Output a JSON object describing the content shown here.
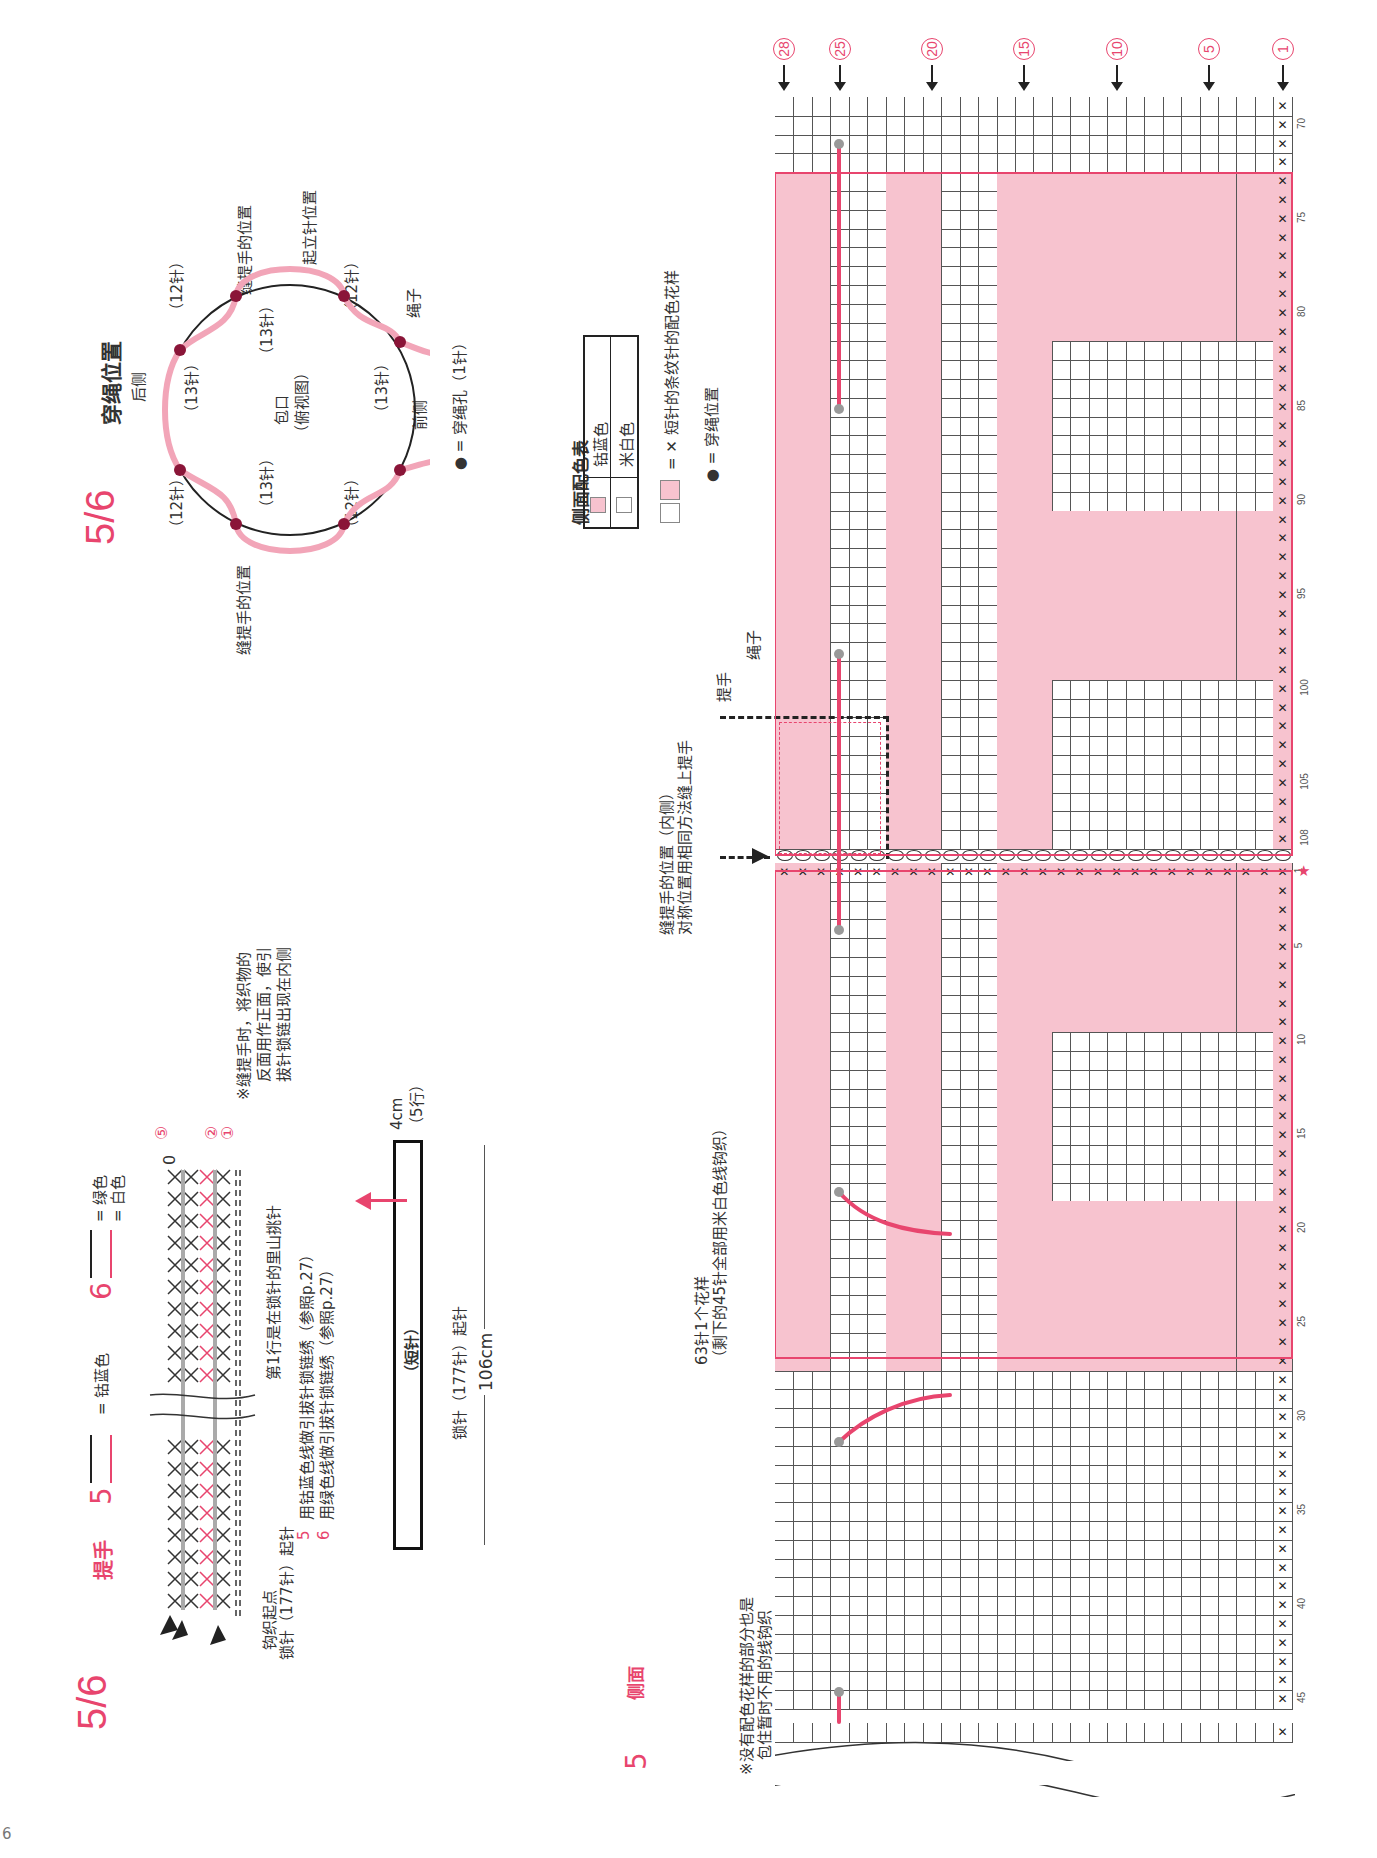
{
  "page_number": "6",
  "section_ring": {
    "number": "5/6",
    "title": "穿绳位置",
    "back_label": "后侧",
    "front_label": "前侧",
    "center_label": "包口",
    "center_sub": "（俯视图）",
    "handle_pos_top": "缝提手的位置",
    "start_pos": "起立针位置",
    "handle_pos_bottom": "缝提手的位置",
    "rope_label": "绳子",
    "hole_legend": "● = 穿绳孔（1针）",
    "segments_outer": [
      "（12针）",
      "（12针）",
      "（12针）",
      "（12针）"
    ],
    "segments_inner": [
      "（13针）",
      "（13针）",
      "（13针）",
      "（13针）"
    ]
  },
  "section_handle": {
    "number": "5/6",
    "title": "提手",
    "color5_label": "5",
    "color5_value": "= 钴蓝色",
    "color6_label": "6",
    "color6_top": "= 绿色",
    "color6_bottom": "= 白色",
    "row_markers": [
      "⑤",
      "②",
      "①"
    ],
    "first_row_note": "第1行是在锁针的里山挑针",
    "start_label": "钩织起点",
    "chain_label": "锁针（177针）起针",
    "note5": "用钴蓝色线做引拔针锁链绣（参照p.27）",
    "note6": "用绿色线做引拔针锁链绣（参照p.27）",
    "note5_num": "5",
    "note6_num": "6",
    "sewing_note": [
      "※缝提手时，将织物的",
      "反面用作正面，使引",
      "拔针锁链出现在内侧"
    ],
    "diagram_label": "（短针）",
    "diagram_chain": "锁针（177针）起针",
    "width": "106cm",
    "height": "4cm",
    "height_rows": "（5行）"
  },
  "section_side": {
    "number": "5",
    "title": "侧面",
    "color_table_title": "侧面配色表",
    "color_table": [
      {
        "swatch": "#f7c3cf",
        "name": "钴蓝色"
      },
      {
        "swatch": "#ffffff",
        "name": "米白色"
      }
    ],
    "stripe_legend": "= ✕ 短针的条纹针的配色花样",
    "dot_legend": "● = 穿绳位置",
    "handle_pos_note": [
      "缝提手的位置（内侧）",
      "对称位置用相同方法缝上提手"
    ],
    "handle_label": "提手",
    "rope_label": "绳子",
    "repeat_note": [
      "63针1个花样",
      "（剩下的45针全部用米白色线钩织）"
    ],
    "wrap_note": [
      "※没有配色花样的部分也是",
      "包住暂时不用的线钩织"
    ],
    "column_markers": [
      "㉘",
      "㉕",
      "⑳",
      "⑮",
      "⑩",
      "⑤",
      "①"
    ],
    "row_labels_top": [
      "70",
      "75",
      "80",
      "85",
      "90",
      "95",
      "100",
      "105",
      "108"
    ],
    "row_labels_bottom": [
      "1",
      "5",
      "10",
      "15",
      "20",
      "25",
      "30",
      "35",
      "40",
      "45"
    ],
    "star": "★"
  },
  "colors": {
    "accent": "#e8456e",
    "pink_fill": "#f7c3cf",
    "grid_line": "#555555",
    "dot": "#8a1538",
    "rope_dot": "#999999"
  }
}
